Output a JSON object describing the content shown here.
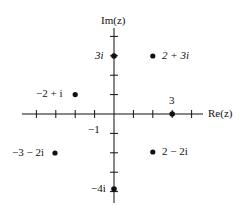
{
  "diagram": {
    "type": "complex-plane",
    "axes": {
      "real_label": "Re(z)",
      "imag_label": "Im(z)",
      "tick_labels": {
        "neg_one": "−1",
        "three": "3"
      }
    },
    "points": [
      {
        "label": "2 + 3i",
        "re": 2,
        "im": 3
      },
      {
        "label": "3i",
        "re": 0,
        "im": 3
      },
      {
        "label": "−2 + i",
        "re": -2,
        "im": 1
      },
      {
        "label": "3",
        "re": 3,
        "im": 0
      },
      {
        "label": "−3 − 2i",
        "re": -3,
        "im": -2
      },
      {
        "label": "2 − 2i",
        "re": 2,
        "im": -2
      },
      {
        "label": "−4i",
        "re": 0,
        "im": -4
      }
    ],
    "colors": {
      "ink": "#111111",
      "background": "#ffffff"
    }
  }
}
